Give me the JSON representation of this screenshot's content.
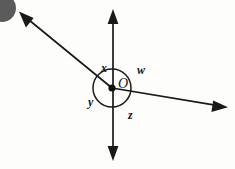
{
  "figure": {
    "background_color": "#fdfdfb",
    "stroke_color": "#1a1a1a",
    "artifact_color": "#5b5b5b",
    "vertex": {
      "label": "O",
      "x": 112,
      "y": 88
    },
    "arc": {
      "center_x": 112,
      "center_y": 88,
      "radius": 19
    },
    "lines": [
      {
        "name": "vertical-line",
        "x1": 113,
        "y1": 12,
        "x2": 113,
        "y2": 158,
        "arrow_start": true,
        "arrow_end": true
      },
      {
        "name": "oblique-line-upper-left",
        "x1": 22,
        "y1": 15,
        "x2": 112,
        "y2": 88,
        "arrow_start": true,
        "arrow_end": false
      },
      {
        "name": "oblique-line-right",
        "x1": 112,
        "y1": 88,
        "x2": 226,
        "y2": 107,
        "arrow_start": false,
        "arrow_end": true
      }
    ],
    "angle_labels": [
      {
        "name": "angle-x",
        "text": "x",
        "x": 101,
        "y": 62
      },
      {
        "name": "angle-w",
        "text": "w",
        "x": 137,
        "y": 64
      },
      {
        "name": "angle-y",
        "text": "y",
        "x": 88,
        "y": 96
      },
      {
        "name": "angle-z",
        "text": "z",
        "x": 128,
        "y": 109
      }
    ],
    "vertex_label": {
      "name": "vertex-label-O",
      "text": "O",
      "x": 118,
      "y": 77
    }
  }
}
